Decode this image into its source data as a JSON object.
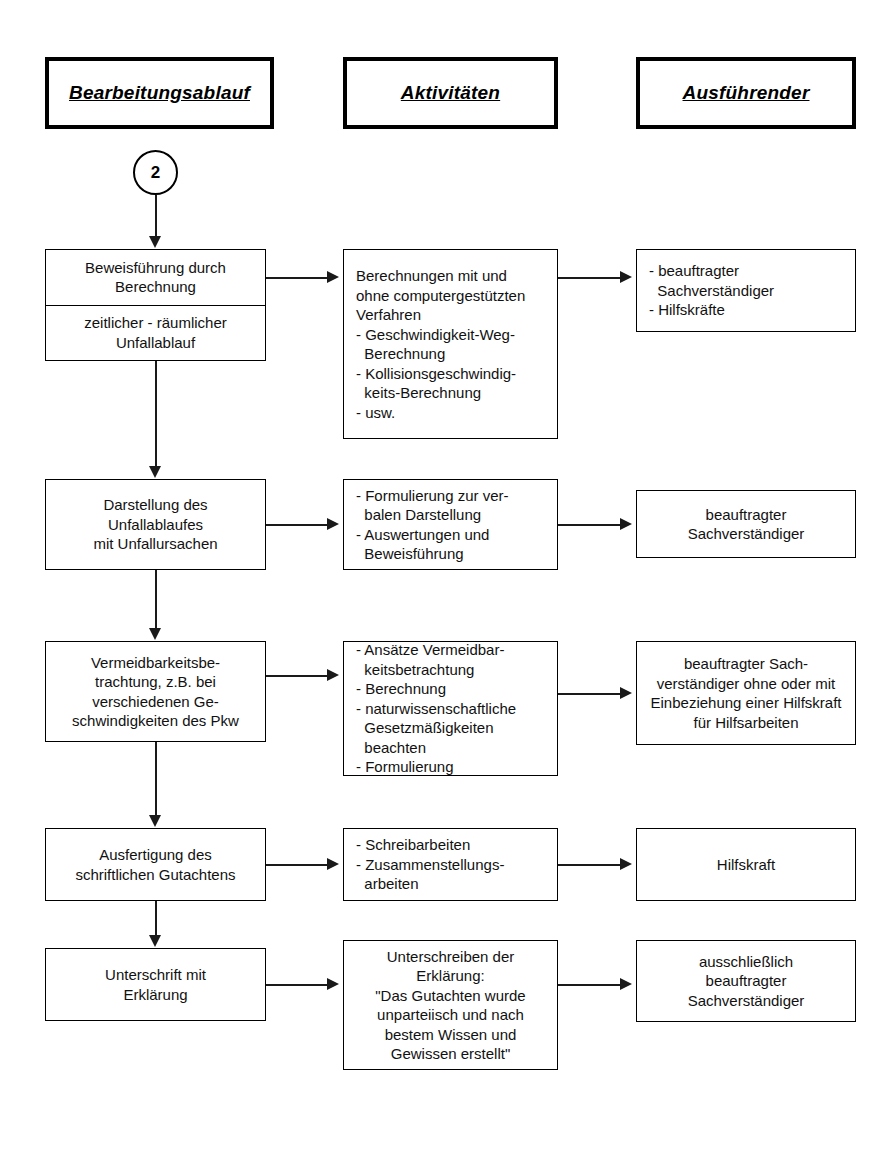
{
  "diagram": {
    "connector_label": "2",
    "headers": [
      {
        "label": "Bearbeitungsablauf"
      },
      {
        "label": "Aktivitäten"
      },
      {
        "label": "Ausführender"
      }
    ],
    "rows": [
      {
        "process": {
          "upper": [
            "Beweisführung durch",
            "Berechnung"
          ],
          "lower": [
            "zeitlicher - räumlicher",
            "Unfallablauf"
          ]
        },
        "activity": [
          "Berechnungen mit und",
          "ohne computergestützten",
          "Verfahren",
          "- Geschwindigkeit-Weg-",
          "  Berechnung",
          "- Kollisionsgeschwindig-",
          "  keits-Berechnung",
          "- usw."
        ],
        "performer": [
          "- beauftragter",
          "  Sachverständiger",
          "- Hilfskräfte"
        ]
      },
      {
        "process": {
          "upper": [
            "Darstellung des",
            "Unfallablaufes",
            "mit Unfallursachen"
          ],
          "lower": []
        },
        "activity": [
          "- Formulierung zur ver-",
          "  balen Darstellung",
          "- Auswertungen und",
          "  Beweisführung"
        ],
        "performer": [
          "beauftragter",
          "Sachverständiger"
        ]
      },
      {
        "process": {
          "upper": [
            "Vermeidbarkeitsbe-",
            "trachtung, z.B. bei",
            "verschiedenen Ge-",
            "schwindigkeiten des Pkw"
          ],
          "lower": []
        },
        "activity": [
          "- Ansätze Vermeidbar-",
          "  keitsbetrachtung",
          "- Berechnung",
          "- naturwissenschaftliche",
          "  Gesetzmäßigkeiten",
          "  beachten",
          "- Formulierung"
        ],
        "performer": [
          "beauftragter Sach-",
          "verständiger ohne oder mit",
          "Einbeziehung einer Hilfskraft",
          "für Hilfsarbeiten"
        ]
      },
      {
        "process": {
          "upper": [
            "Ausfertigung des",
            "schriftlichen Gutachtens"
          ],
          "lower": []
        },
        "activity": [
          "- Schreibarbeiten",
          "- Zusammenstellungs-",
          "  arbeiten"
        ],
        "performer": [
          "Hilfskraft"
        ]
      },
      {
        "process": {
          "upper": [
            "Unterschrift mit",
            "Erklärung"
          ],
          "lower": []
        },
        "activity": [
          "Unterschreiben der",
          "Erklärung:",
          "\"Das Gutachten wurde",
          "unparteiisch und nach",
          "bestem Wissen und",
          "Gewissen erstellt\""
        ],
        "performer": [
          "ausschließlich",
          "beauftragter",
          "Sachverständiger"
        ]
      }
    ]
  },
  "colors": {
    "line": "#1a1a1a",
    "border": "#000000",
    "background": "#ffffff",
    "text": "#111111"
  }
}
